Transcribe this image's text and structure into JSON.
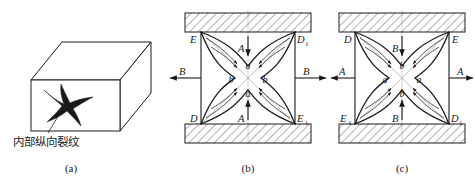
{
  "figure": {
    "background": "#ffffff",
    "line_color": "#1a1a1a",
    "hatch_color": "#555555",
    "guide_color": "#9a9a9a",
    "panels": [
      {
        "id": "a",
        "caption": "(a)",
        "type": "isometric-bar",
        "annotation": {
          "label": "内部纵向裂纹",
          "meaning": "internal-longitudinal-crack"
        },
        "crack_shape": "four-pointed-star"
      },
      {
        "id": "b",
        "caption": "(b)",
        "type": "square-cross-section-deformation",
        "corner_labels": {
          "top_left": "E",
          "top_right": "D",
          "top_right_sub": "1",
          "bottom_left": "D",
          "bottom_right": "E",
          "bottom_right_sub": "1"
        },
        "center_labels": {
          "top": "a",
          "left": "b",
          "right": "b",
          "bottom": "a"
        },
        "force_labels": {
          "vertical": "A",
          "horizontal": "B"
        },
        "vertical_direction": "inward",
        "horizontal_direction": "outward",
        "platens": "top-and-bottom"
      },
      {
        "id": "c",
        "caption": "(c)",
        "type": "square-cross-section-deformation",
        "corner_labels": {
          "top_left": "D",
          "top_right": "E",
          "bottom_left": "E",
          "bottom_left_sub": "1",
          "bottom_right": "D",
          "bottom_right_sub": "1"
        },
        "center_labels": {
          "top": "b",
          "left": "a",
          "right": "a",
          "bottom": "b"
        },
        "force_labels": {
          "vertical": "B",
          "horizontal": "A"
        },
        "vertical_direction": "inward",
        "horizontal_direction": "outward",
        "platens": "top-and-bottom"
      }
    ]
  }
}
